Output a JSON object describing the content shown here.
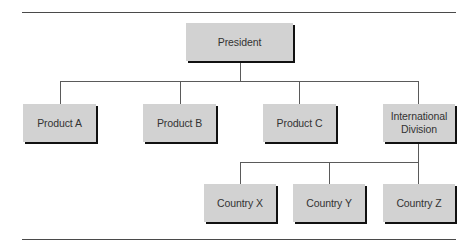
{
  "chart": {
    "root": {
      "label": "President"
    },
    "level1": [
      {
        "label": "Product A"
      },
      {
        "label": "Product B"
      },
      {
        "label": "Product C"
      },
      {
        "label": "International Division",
        "line1": "International",
        "line2": "Division"
      }
    ],
    "level2": [
      {
        "label": "Country X"
      },
      {
        "label": "Country Y"
      },
      {
        "label": "Country Z"
      }
    ]
  },
  "colors": {
    "box_fill": "#d2d2d2",
    "shadow": "#111111",
    "line": "#5a5a5a"
  }
}
